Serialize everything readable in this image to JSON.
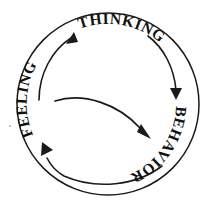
{
  "diagram": {
    "type": "cycle",
    "background_color": "#ffffff",
    "stroke_color": "#1a1a1a",
    "nodes": [
      {
        "id": "thinking",
        "label": "THINKING",
        "position": "top",
        "angle_deg": 270
      },
      {
        "id": "behavior",
        "label": "BEHAVIOR",
        "position": "right",
        "angle_deg": 35
      },
      {
        "id": "feeling",
        "label": "FEELING",
        "position": "left",
        "angle_deg": 195
      }
    ],
    "edges": [
      {
        "id": "feeling-to-thinking",
        "from": "feeling",
        "to": "thinking",
        "style": "curved-arrow",
        "direction": "clockwise"
      },
      {
        "id": "thinking-to-behavior",
        "from": "thinking",
        "to": "behavior",
        "style": "curved-arrow",
        "direction": "clockwise"
      },
      {
        "id": "behavior-to-feeling",
        "from": "behavior",
        "to": "feeling",
        "style": "curved-arrow",
        "direction": "clockwise"
      },
      {
        "id": "inner-cross-arrow",
        "from": "feeling",
        "to": "behavior",
        "style": "inner-curved-arrow",
        "direction": "across"
      }
    ]
  }
}
